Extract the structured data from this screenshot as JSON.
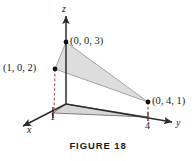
{
  "figure": {
    "caption": "FIGURE 18",
    "axes": {
      "x_label": "x",
      "y_label": "y",
      "z_label": "z"
    },
    "ticks": {
      "x_tick": "1",
      "y_tick": "4"
    },
    "points": [
      {
        "name": "point-z-intercept",
        "label": "(0, 0, 3)",
        "coords": [
          0,
          0,
          3
        ]
      },
      {
        "name": "point-xz",
        "label": "(1, 0, 2)",
        "coords": [
          1,
          0,
          2
        ]
      },
      {
        "name": "point-yz",
        "label": "(0, 4, 1)",
        "coords": [
          0,
          4,
          1
        ]
      }
    ],
    "colors": {
      "axis": "#2b2b2b",
      "plane_fill": "#d9d9d9",
      "base_fill": "#cfcfcf",
      "dashed_projection": "#b04a3c",
      "point": "#111111",
      "text": "#1a1a1a",
      "background": "#ffffff"
    }
  }
}
